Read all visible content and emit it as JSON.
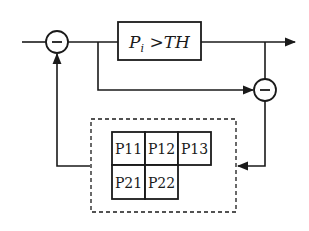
{
  "diagram": {
    "threshold_block": {
      "label_main": "P",
      "label_sub": "i",
      "label_rest": " >TH"
    },
    "summing_junctions": [
      {
        "id": "sum-left",
        "symbol": "−"
      },
      {
        "id": "sum-right",
        "symbol": "−"
      }
    ],
    "grid": {
      "rows": [
        [
          "P11",
          "P12",
          "P13"
        ],
        [
          "P21",
          "P22"
        ]
      ]
    },
    "colors": {
      "stroke": "#1a1a1a",
      "background": "#ffffff"
    }
  }
}
